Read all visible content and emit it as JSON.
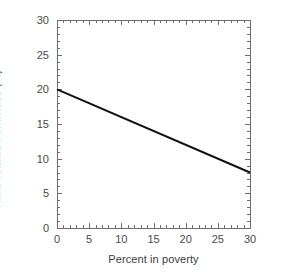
{
  "chart_data": {
    "type": "line",
    "title": "",
    "subtitle": "",
    "xlabel": "Percent in poverty",
    "ylabel": "Knife-related homicides (%)",
    "xlim": [
      0,
      30
    ],
    "ylim": [
      0,
      30
    ],
    "x_ticks": [
      0,
      5,
      10,
      15,
      20,
      25,
      30
    ],
    "y_ticks": [
      0,
      5,
      10,
      15,
      20,
      25,
      30
    ],
    "x_tick_labels": [
      "0",
      "5",
      "10",
      "15",
      "20",
      "25",
      "30"
    ],
    "y_tick_labels": [
      "0",
      "5",
      "10",
      "15",
      "20",
      "25",
      "30"
    ],
    "x_minor_tick_step": 1,
    "y_minor_tick_step": 1,
    "grid": false,
    "legend": false,
    "legend_position": "none",
    "frame": "box",
    "tick_direction": "in",
    "series": [
      {
        "name": "fitted line",
        "style": "solid",
        "color": "#111111",
        "line_width": 2,
        "x": [
          0,
          30
        ],
        "values": [
          20,
          8
        ]
      }
    ],
    "annotations": []
  },
  "axis_colors": {
    "frame": "#6e6e6e",
    "tick": "#6e6e6e",
    "text": "#3d3d3d",
    "data_line": "#111111",
    "background": "#ffffff"
  },
  "geometry": {
    "plot_left": 57,
    "plot_right": 250,
    "plot_top": 20,
    "plot_bottom": 228
  }
}
